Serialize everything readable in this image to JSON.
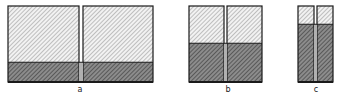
{
  "figures": [
    {
      "label": "a",
      "panels": 2,
      "dark_fraction": 0.26
    },
    {
      "label": "b",
      "panels": 2,
      "dark_fraction": 0.51
    },
    {
      "label": "c",
      "panels": 2,
      "dark_fraction": 0.76
    }
  ],
  "colors": {
    "outline": "#1a1a1a",
    "light_fill": "#f2f2f2",
    "light_hatch": "#8a8a8a",
    "dark_fill": "#8c8c8c",
    "dark_hatch": "#2e2e2e"
  }
}
